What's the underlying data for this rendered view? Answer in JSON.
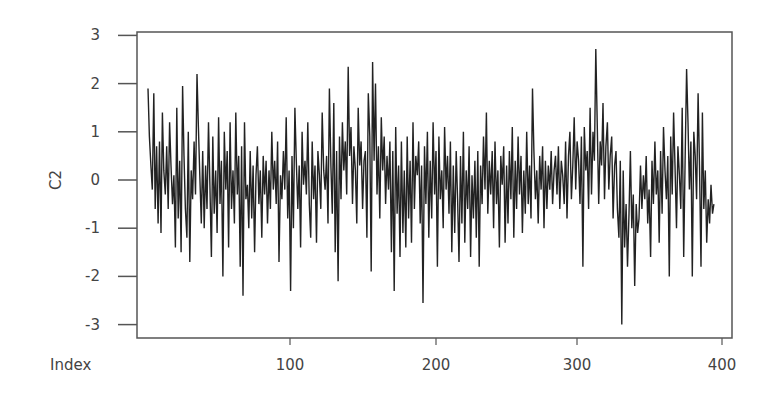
{
  "chart_data": {
    "type": "line",
    "title": "",
    "xlabel": "Index",
    "ylabel": "C2",
    "xlim": [
      1,
      400
    ],
    "ylim": [
      -3.2,
      3.1
    ],
    "x_ticks": [
      100,
      200,
      300,
      400
    ],
    "y_ticks": [
      -3,
      -2,
      -1,
      0,
      1,
      2,
      3
    ],
    "grid": false,
    "legend": null,
    "series": [
      {
        "name": "C2",
        "color": "#222222",
        "values": [
          1.9,
          0.9,
          0.3,
          -0.2,
          1.8,
          -0.6,
          0.7,
          -0.9,
          0.8,
          -1.1,
          1.4,
          0.2,
          -0.3,
          0.7,
          -0.6,
          1.2,
          0.3,
          -0.5,
          0.1,
          -1.4,
          1.5,
          -0.8,
          0.4,
          -1.5,
          1.95,
          0.5,
          -0.6,
          -1.2,
          1.0,
          -1.7,
          0.2,
          -0.4,
          0.8,
          -0.3,
          2.2,
          1.1,
          0.1,
          -0.9,
          0.6,
          -1.0,
          0.3,
          -0.6,
          1.2,
          -0.1,
          -1.6,
          0.9,
          -0.7,
          0.2,
          -1.1,
          1.3,
          -0.5,
          0.4,
          -2.0,
          1.0,
          -0.2,
          0.6,
          -1.4,
          1.2,
          -0.6,
          0.2,
          -0.9,
          1.4,
          -0.3,
          0.5,
          -1.8,
          0.7,
          -2.4,
          1.2,
          -0.4,
          -0.1,
          -1.0,
          0.6,
          -0.8,
          0.3,
          -1.5,
          0.1,
          0.7,
          -0.5,
          0.2,
          -1.2,
          0.5,
          -0.3,
          0.4,
          -0.9,
          0.2,
          -0.6,
          1.0,
          -0.2,
          0.4,
          -0.5,
          0.8,
          -1.7,
          0.1,
          -0.4,
          0.6,
          -0.2,
          1.3,
          -0.8,
          0.2,
          -2.3,
          0.5,
          -1.0,
          1.5,
          0.4,
          -0.6,
          0.3,
          -1.4,
          1.0,
          -0.1,
          0.4,
          -0.3,
          1.2,
          -0.5,
          -1.2,
          0.8,
          -0.4,
          0.3,
          -1.3,
          0.6,
          0.1,
          -0.6,
          1.4,
          0.2,
          -0.2,
          0.5,
          -0.9,
          1.9,
          0.3,
          -0.7,
          1.6,
          -1.5,
          0.6,
          -2.1,
          0.9,
          -0.4,
          1.2,
          0.2,
          0.8,
          -0.3,
          2.35,
          0.5,
          1.1,
          -0.5,
          0.7,
          0.2,
          -0.9,
          1.5,
          0.3,
          0.8,
          -0.6,
          0.4,
          0.6,
          -1.2,
          1.8,
          0.9,
          -1.9,
          2.45,
          0.4,
          2.0,
          -0.3,
          0.7,
          -0.8,
          1.3,
          0.2,
          0.9,
          -0.5,
          0.5,
          -0.2,
          0.8,
          -1.5,
          0.6,
          -2.3,
          1.1,
          -0.7,
          0.3,
          -1.6,
          0.8,
          -1.1,
          0.2,
          -1.4,
          0.9,
          -0.8,
          0.4,
          -1.3,
          1.2,
          -0.6,
          0.5,
          0.1,
          0.8,
          -0.9,
          0.3,
          -2.55,
          0.7,
          -0.5,
          1.0,
          -1.2,
          0.4,
          -0.8,
          1.2,
          -0.3,
          0.6,
          -1.8,
          0.9,
          -0.4,
          0.2,
          -1.0,
          1.1,
          -0.2,
          0.5,
          -0.7,
          0.8,
          -1.5,
          0.3,
          -1.1,
          0.6,
          -0.4,
          -1.7,
          0.5,
          -0.9,
          1.0,
          -1.3,
          0.2,
          -0.6,
          0.7,
          -1.6,
          0.1,
          -0.8,
          0.4,
          -1.2,
          0.6,
          -1.8,
          0.3,
          -0.5,
          0.9,
          -0.2,
          1.4,
          -0.7,
          0.4,
          -0.3,
          0.6,
          -1.0,
          0.8,
          -0.5,
          0.2,
          -1.4,
          0.5,
          -0.1,
          0.7,
          -1.3,
          0.3,
          -0.9,
          0.6,
          -0.4,
          1.1,
          -1.2,
          0.4,
          -0.6,
          0.9,
          -0.3,
          0.5,
          -1.1,
          0.2,
          -0.7,
          1.0,
          -0.5,
          0.3,
          -0.8,
          1.9,
          0.6,
          -0.4,
          0.2,
          -0.9,
          0.5,
          -0.2,
          0.7,
          -1.0,
          0.4,
          -0.6,
          0.3,
          -0.2,
          0.6,
          -0.5,
          0.2,
          0.5,
          -0.3,
          0.7,
          -0.6,
          0.4,
          0.1,
          -0.5,
          0.8,
          -0.8,
          0.5,
          1.0,
          -0.4,
          0.3,
          1.3,
          -0.2,
          0.8,
          0.4,
          -0.5,
          0.9,
          -1.8,
          1.1,
          0.2,
          0.6,
          -0.6,
          1.5,
          -0.3,
          1.0,
          0.4,
          2.72,
          1.1,
          -0.5,
          0.8,
          0.3,
          1.6,
          -0.4,
          0.7,
          1.2,
          -0.2,
          0.5,
          0.9,
          -0.8,
          0.3,
          0.6,
          -0.6,
          -1.2,
          0.4,
          -3.0,
          0.2,
          -1.4,
          -0.5,
          -1.8,
          -0.7,
          0.6,
          -1.0,
          -0.3,
          -2.2,
          -0.5,
          -1.1,
          -0.8,
          0.3,
          -0.6,
          0.1,
          -0.4,
          0.5,
          -0.9,
          -0.2,
          -1.6,
          0.4,
          -0.5,
          0.8,
          -0.3,
          0.2,
          -1.3,
          0.6,
          -0.7,
          1.1,
          0.2,
          -0.4,
          0.5,
          -2.0,
          0.9,
          -0.3,
          1.4,
          0.3,
          -1.0,
          0.7,
          0.1,
          -0.6,
          1.5,
          -1.6,
          0.4,
          2.3,
          1.2,
          -0.2,
          0.8,
          -2.0,
          1.0,
          0.5,
          -0.4,
          1.8,
          0.3,
          -1.8,
          1.4,
          -0.6,
          0.2,
          -1.3,
          -0.4,
          -0.9,
          -0.1,
          -0.7,
          -0.5
        ]
      }
    ],
    "plot_area_px": {
      "left": 137,
      "top": 32,
      "right": 732,
      "bottom": 338
    },
    "x_scale_px": {
      "index_at_left": 1,
      "x_at_index_1": 148,
      "px_per_index": 1.44
    },
    "y_scale_px": {
      "y_at_zero": 180,
      "px_per_unit": 48.2
    }
  }
}
